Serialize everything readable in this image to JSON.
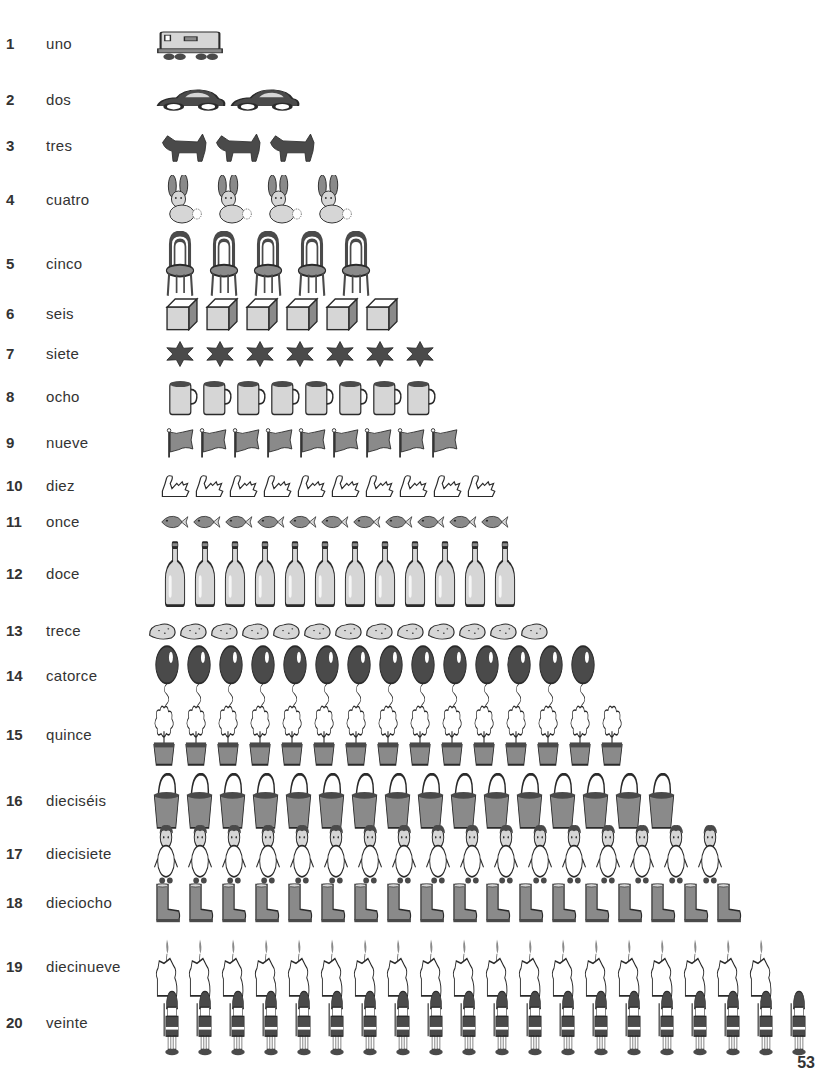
{
  "page_number": "53",
  "rows": [
    {
      "number": "1",
      "word": "uno",
      "object": "train-locomotive",
      "count": 1,
      "y": 44,
      "items_x": 155,
      "item_w": 70,
      "item_h": 40,
      "gap": 2
    },
    {
      "number": "2",
      "word": "dos",
      "object": "car",
      "count": 2,
      "y": 100,
      "items_x": 155,
      "item_w": 72,
      "item_h": 28,
      "gap": 2
    },
    {
      "number": "3",
      "word": "tres",
      "object": "scottie-dog",
      "count": 3,
      "y": 146,
      "items_x": 160,
      "item_w": 50,
      "item_h": 34,
      "gap": 4
    },
    {
      "number": "4",
      "word": "cuatro",
      "object": "rabbit",
      "count": 4,
      "y": 200,
      "items_x": 160,
      "item_w": 44,
      "item_h": 50,
      "gap": 6
    },
    {
      "number": "5",
      "word": "cinco",
      "object": "chair",
      "count": 5,
      "y": 264,
      "items_x": 163,
      "item_w": 34,
      "item_h": 66,
      "gap": 10
    },
    {
      "number": "6",
      "word": "seis",
      "object": "cube",
      "count": 6,
      "y": 314,
      "items_x": 165,
      "item_w": 34,
      "item_h": 34,
      "gap": 6
    },
    {
      "number": "7",
      "word": "siete",
      "object": "star",
      "count": 7,
      "y": 354,
      "items_x": 165,
      "item_w": 30,
      "item_h": 26,
      "gap": 10
    },
    {
      "number": "8",
      "word": "ocho",
      "object": "mug",
      "count": 8,
      "y": 397,
      "items_x": 168,
      "item_w": 30,
      "item_h": 38,
      "gap": 4
    },
    {
      "number": "9",
      "word": "nueve",
      "object": "flag",
      "count": 9,
      "y": 443,
      "items_x": 165,
      "item_w": 29,
      "item_h": 30,
      "gap": 4
    },
    {
      "number": "10",
      "word": "diez",
      "object": "swan",
      "count": 10,
      "y": 486,
      "items_x": 160,
      "item_w": 30,
      "item_h": 26,
      "gap": 4
    },
    {
      "number": "11",
      "word": "once",
      "object": "fish",
      "count": 11,
      "y": 522,
      "items_x": 160,
      "item_w": 29,
      "item_h": 22,
      "gap": 3
    },
    {
      "number": "12",
      "word": "doce",
      "object": "bottle",
      "count": 12,
      "y": 574,
      "items_x": 163,
      "item_w": 24,
      "item_h": 66,
      "gap": 6
    },
    {
      "number": "13",
      "word": "trece",
      "object": "potato",
      "count": 13,
      "y": 631,
      "items_x": 148,
      "item_w": 29,
      "item_h": 22,
      "gap": 2
    },
    {
      "number": "14",
      "word": "catorce",
      "object": "balloon",
      "count": 14,
      "y": 676,
      "items_x": 153,
      "item_w": 28,
      "item_h": 62,
      "gap": 4
    },
    {
      "number": "15",
      "word": "quince",
      "object": "potted-plant",
      "count": 15,
      "y": 735,
      "items_x": 150,
      "item_w": 28,
      "item_h": 62,
      "gap": 4
    },
    {
      "number": "16",
      "word": "dieciséis",
      "object": "bucket",
      "count": 16,
      "y": 801,
      "items_x": 152,
      "item_w": 29,
      "item_h": 56,
      "gap": 4
    },
    {
      "number": "17",
      "word": "diecisiete",
      "object": "child",
      "count": 17,
      "y": 854,
      "items_x": 150,
      "item_w": 32,
      "item_h": 60,
      "gap": 2
    },
    {
      "number": "18",
      "word": "dieciocho",
      "object": "boot",
      "count": 18,
      "y": 903,
      "items_x": 153,
      "item_w": 28,
      "item_h": 40,
      "gap": 5
    },
    {
      "number": "19",
      "word": "diecinueve",
      "object": "candle",
      "count": 19,
      "y": 967,
      "items_x": 152,
      "item_w": 30,
      "item_h": 60,
      "gap": 3
    },
    {
      "number": "20",
      "word": "veinte",
      "object": "toy-soldier",
      "count": 20,
      "y": 1023,
      "items_x": 158,
      "item_w": 28,
      "item_h": 66,
      "gap": 5
    }
  ],
  "colors": {
    "ink": "#2a2a2a",
    "dark_fill": "#4a4a4a",
    "mid_fill": "#8a8a8a",
    "light_fill": "#d6d6d6",
    "paper": "#ffffff"
  }
}
